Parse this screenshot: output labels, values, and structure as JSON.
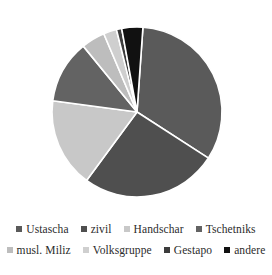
{
  "chart_data": {
    "type": "pie",
    "title": "",
    "subtitle": "",
    "xlabel": "",
    "ylabel": "",
    "legend_position": "bottom",
    "grid": false,
    "start_angle_deg": -86,
    "direction": "clockwise",
    "categories": [
      "Ustascha",
      "zivil",
      "Handschar",
      "Tschetniks",
      "musl. Miliz",
      "Volksgruppe",
      "Gestapo",
      "andere"
    ],
    "values": [
      33,
      26,
      17,
      12,
      4.5,
      2.5,
      1,
      4
    ],
    "slices": [
      {
        "label": "Ustascha",
        "value": 33,
        "color": "#5a5a5a"
      },
      {
        "label": "zivil",
        "value": 26,
        "color": "#4f4f4f"
      },
      {
        "label": "Handschar",
        "value": 17,
        "color": "#c8c8c8"
      },
      {
        "label": "Tschetniks",
        "value": 12,
        "color": "#636363"
      },
      {
        "label": "musl. Miliz",
        "value": 4.5,
        "color": "#bdbdbd"
      },
      {
        "label": "Volksgruppe",
        "value": 2.5,
        "color": "#cfcfcf"
      },
      {
        "label": "Gestapo",
        "value": 1,
        "color": "#3c3c3c"
      },
      {
        "label": "andere",
        "value": 4,
        "color": "#111111"
      }
    ]
  },
  "legend": {
    "rows": [
      [
        {
          "label": "Ustascha",
          "color": "#5a5a5a"
        },
        {
          "label": "zivil",
          "color": "#4f4f4f"
        },
        {
          "label": "Handschar",
          "color": "#c8c8c8"
        },
        {
          "label": "Tschetniks",
          "color": "#636363"
        }
      ],
      [
        {
          "label": "musl. Miliz",
          "color": "#bdbdbd"
        },
        {
          "label": "Volksgruppe",
          "color": "#cfcfcf"
        },
        {
          "label": "Gestapo",
          "color": "#3c3c3c"
        },
        {
          "label": "andere",
          "color": "#111111"
        }
      ]
    ]
  },
  "geometry": {
    "center_x": 137,
    "center_y": 112,
    "radius": 85,
    "separator_color": "#ffffff",
    "separator_width": 1.6
  }
}
